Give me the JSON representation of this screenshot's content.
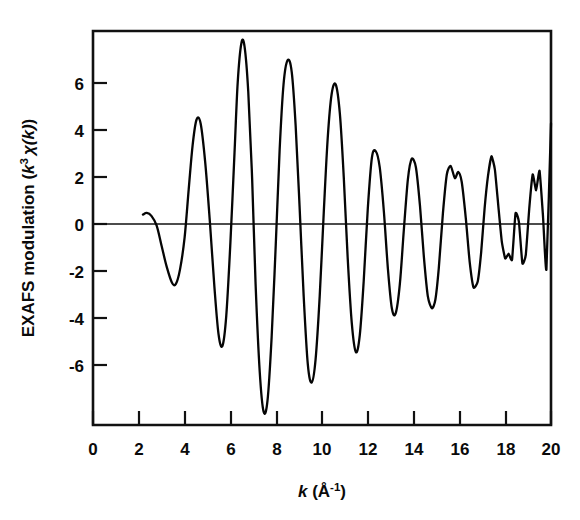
{
  "chart_data": {
    "type": "line",
    "title": "",
    "xlabel": "k (Å⁻¹)",
    "ylabel": "EXAFS modulation (k³ χ(k))",
    "xlabel_parts": {
      "symbol": "k",
      "open": " (",
      "unit": "Å",
      "exponent": "-1",
      "close": ")"
    },
    "ylabel_parts": {
      "prefix": "EXAFS modulation  (",
      "k": "k",
      "power": "3",
      "chi": "χ",
      "arg": "(k)",
      "close": ")"
    },
    "xlim": [
      0,
      20
    ],
    "ylim": [
      -8.1,
      8.1
    ],
    "xticks": [
      0,
      2,
      4,
      6,
      8,
      10,
      12,
      14,
      16,
      18,
      20
    ],
    "yticks": [
      6,
      4,
      2,
      0,
      -2,
      -4,
      -6
    ],
    "xtick_labels": [
      "0",
      "2",
      "4",
      "6",
      "8",
      "10",
      "12",
      "14",
      "16",
      "18",
      "20"
    ],
    "ytick_labels": [
      "6",
      "4",
      "2",
      "0",
      "-2",
      "-4",
      "-6"
    ],
    "grid": false,
    "legend": null,
    "zero_line": true,
    "frame": "box",
    "series": [
      {
        "name": "k3-weighted EXAFS chi(k)",
        "color": "#050505",
        "linewidth": 2.3,
        "x": [
          2.18,
          2.35,
          2.55,
          2.78,
          3.0,
          3.22,
          3.45,
          3.62,
          3.8,
          4.0,
          4.18,
          4.35,
          4.52,
          4.7,
          4.9,
          5.1,
          5.3,
          5.48,
          5.65,
          5.82,
          6.0,
          6.18,
          6.32,
          6.48,
          6.62,
          6.78,
          6.95,
          7.1,
          7.28,
          7.45,
          7.62,
          7.8,
          7.98,
          8.15,
          8.32,
          8.5,
          8.68,
          8.85,
          9.02,
          9.2,
          9.38,
          9.55,
          9.72,
          9.9,
          10.08,
          10.25,
          10.42,
          10.6,
          10.78,
          10.95,
          11.12,
          11.3,
          11.48,
          11.65,
          11.82,
          12.0,
          12.18,
          12.35,
          12.52,
          12.7,
          12.88,
          13.05,
          13.22,
          13.4,
          13.58,
          13.75,
          13.92,
          14.1,
          14.28,
          14.45,
          14.62,
          14.8,
          14.95,
          15.1,
          15.28,
          15.45,
          15.62,
          15.8,
          15.95,
          16.1,
          16.28,
          16.45,
          16.62,
          16.8,
          16.95,
          17.1,
          17.25,
          17.4,
          17.55,
          17.7,
          17.85,
          18.0,
          18.15,
          18.3,
          18.45,
          18.6,
          18.75,
          18.9,
          19.05,
          19.2,
          19.35,
          19.5,
          19.65,
          19.8,
          20.0
        ],
        "y": [
          0.55,
          0.62,
          0.5,
          0.1,
          -0.75,
          -1.6,
          -2.25,
          -2.3,
          -1.7,
          -0.4,
          1.6,
          3.4,
          4.45,
          4.3,
          2.7,
          0.3,
          -2.4,
          -4.35,
          -4.85,
          -3.6,
          -0.6,
          3.1,
          6.0,
          7.6,
          7.45,
          5.6,
          2.0,
          -2.3,
          -5.9,
          -7.55,
          -7.1,
          -4.5,
          -0.7,
          3.2,
          5.9,
          6.9,
          6.4,
          4.2,
          0.9,
          -2.8,
          -5.6,
          -6.35,
          -5.4,
          -2.8,
          0.7,
          3.7,
          5.5,
          5.9,
          4.7,
          2.1,
          -1.2,
          -3.9,
          -5.1,
          -4.4,
          -2.2,
          0.8,
          2.9,
          3.15,
          2.5,
          0.7,
          -1.7,
          -3.3,
          -3.5,
          -2.3,
          0.0,
          2.0,
          2.85,
          2.5,
          0.9,
          -1.2,
          -2.8,
          -3.3,
          -2.95,
          -1.65,
          0.6,
          2.2,
          2.55,
          2.05,
          2.3,
          1.9,
          0.4,
          -1.4,
          -2.45,
          -2.2,
          -1.0,
          0.8,
          2.15,
          2.95,
          2.4,
          0.9,
          -0.55,
          -1.25,
          -1.05,
          -1.3,
          0.6,
          0.25,
          -1.45,
          -1.1,
          0.8,
          2.2,
          1.55,
          2.35,
          0.5,
          -1.7,
          4.3
        ],
        "start_k": 2.18,
        "end_k": 20.0,
        "max_amplitude": 7.6,
        "min_amplitude": -7.55
      }
    ]
  },
  "plot_geometry": {
    "left_px": 93,
    "right_px": 551,
    "top_px": 31,
    "bottom_px": 425,
    "zero_y_px": 224
  },
  "colors": {
    "ink": "#050505",
    "background": "#ffffff"
  }
}
